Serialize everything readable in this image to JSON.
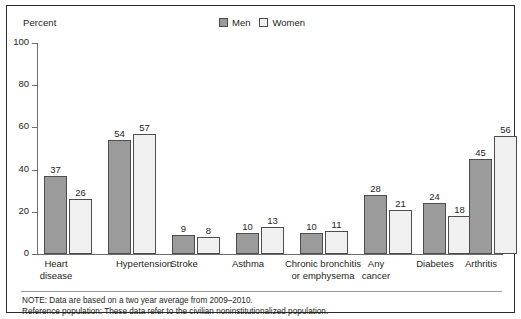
{
  "axis": {
    "y_title": "Percent",
    "ticks": [
      100,
      80,
      60,
      40,
      20,
      0
    ]
  },
  "legend": {
    "position": "top-center",
    "items": [
      {
        "label": "Men",
        "color": "#9b9b9b",
        "key": "men"
      },
      {
        "label": "Women",
        "color": "#f0f0f0",
        "key": "women"
      }
    ]
  },
  "notes": {
    "line1": "NOTE: Data are based on a two year average from 2009–2010.",
    "line2": "Reference population: These data refer to the civilian noninstitutionalized population."
  },
  "categories": [
    "Heart\ndisease",
    "Hypertension",
    "Stroke",
    "Asthma",
    "Chronic bronchitis\nor emphysema",
    "Any\ncancer",
    "Diabetes",
    "Arthritis"
  ],
  "values": {
    "men": [
      37,
      54,
      9,
      10,
      10,
      28,
      24,
      45
    ],
    "women": [
      26,
      57,
      8,
      13,
      11,
      21,
      18,
      56
    ]
  },
  "chart_data": {
    "type": "bar",
    "title": "",
    "xlabel": "",
    "ylabel": "Percent",
    "ylim": [
      0,
      100
    ],
    "yticks": [
      0,
      20,
      40,
      60,
      80,
      100
    ],
    "grid": false,
    "legend_position": "top-center",
    "categories": [
      "Heart disease",
      "Hypertension",
      "Stroke",
      "Asthma",
      "Chronic bronchitis or emphysema",
      "Any cancer",
      "Diabetes",
      "Arthritis"
    ],
    "series": [
      {
        "name": "Men",
        "color": "#9b9b9b",
        "values": [
          37,
          54,
          9,
          10,
          10,
          28,
          24,
          45
        ]
      },
      {
        "name": "Women",
        "color": "#f0f0f0",
        "values": [
          26,
          57,
          8,
          13,
          11,
          21,
          18,
          56
        ]
      }
    ],
    "annotations": [
      "NOTE: Data are based on a two year average from 2009–2010.",
      "Reference population: These data refer to the civilian noninstitutionalized population."
    ]
  }
}
